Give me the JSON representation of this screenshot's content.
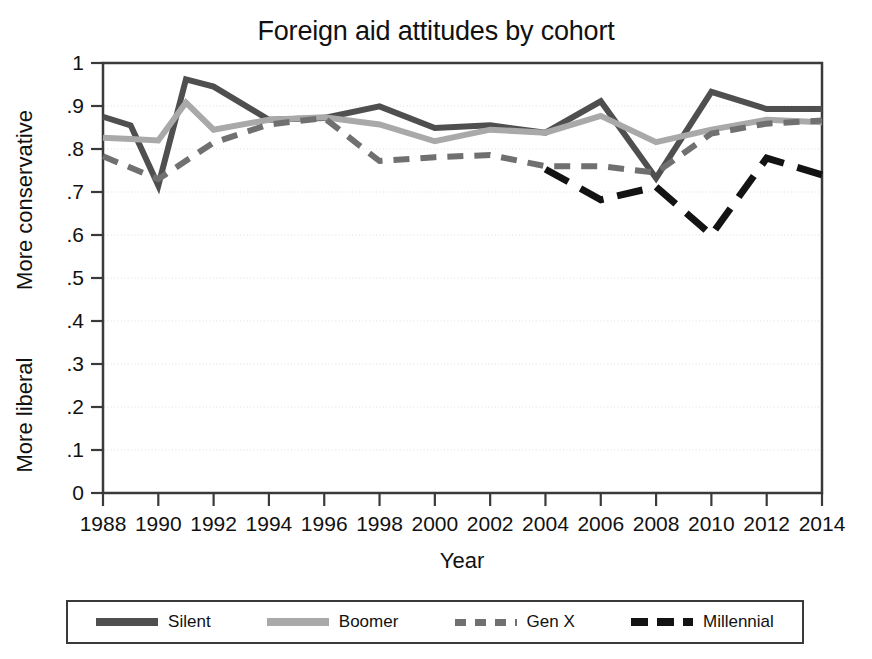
{
  "chart_data": {
    "type": "line",
    "title": "Foreign aid attitudes by cohort",
    "xlabel": "Year",
    "ylabel": "",
    "ylabel_top": "More conservative",
    "ylabel_bottom": "More liberal",
    "grid": true,
    "legend_position": "bottom",
    "xlim": [
      1988,
      2014
    ],
    "ylim": [
      0,
      1
    ],
    "x_ticks": [
      1988,
      1990,
      1992,
      1994,
      1996,
      1998,
      2000,
      2002,
      2004,
      2006,
      2008,
      2010,
      2012,
      2014
    ],
    "x_tick_labels": [
      "1988",
      "1990",
      "1992",
      "1994",
      "1996",
      "1998",
      "2000",
      "2002",
      "2004",
      "2006",
      "2008",
      "2010",
      "2012",
      "2014"
    ],
    "y_ticks": [
      0,
      0.1,
      0.2,
      0.3,
      0.4,
      0.5,
      0.6,
      0.7,
      0.8,
      0.9,
      1
    ],
    "y_tick_labels": [
      "0",
      ".1",
      ".2",
      ".3",
      ".4",
      ".5",
      ".6",
      ".7",
      ".8",
      ".9",
      "1"
    ],
    "series": [
      {
        "name": "Silent",
        "color": "#4f4f4f",
        "style": "solid",
        "width": 6,
        "x": [
          1988,
          1989,
          1990,
          1991,
          1992,
          1994,
          1996,
          1998,
          2000,
          2002,
          2004,
          2006,
          2008,
          2010,
          2012,
          2014
        ],
        "values": [
          0.875,
          0.855,
          0.715,
          0.962,
          0.945,
          0.868,
          0.872,
          0.899,
          0.849,
          0.855,
          0.838,
          0.911,
          0.732,
          0.933,
          0.893,
          0.893
        ]
      },
      {
        "name": "Boomer",
        "color": "#a9a9a9",
        "style": "solid",
        "width": 6,
        "x": [
          1988,
          1989,
          1990,
          1991,
          1992,
          1994,
          1996,
          1998,
          2000,
          2002,
          2004,
          2006,
          2008,
          2010,
          2012,
          2014
        ],
        "values": [
          0.826,
          0.823,
          0.82,
          0.908,
          0.845,
          0.868,
          0.874,
          0.857,
          0.818,
          0.845,
          0.838,
          0.877,
          0.816,
          0.845,
          0.868,
          0.862
        ]
      },
      {
        "name": "Gen X",
        "color": "#707070",
        "style": "dashed",
        "width": 6,
        "dash": "16,11",
        "x": [
          1988,
          1990,
          1992,
          1994,
          1996,
          1998,
          2000,
          2002,
          2004,
          2006,
          2008,
          2010,
          2012,
          2014
        ],
        "values": [
          0.783,
          0.73,
          0.815,
          0.857,
          0.872,
          0.772,
          0.781,
          0.786,
          0.76,
          0.76,
          0.745,
          0.836,
          0.859,
          0.866
        ]
      },
      {
        "name": "Millennial",
        "color": "#131313",
        "style": "dashed",
        "width": 7,
        "dash": "26,14",
        "x": [
          2004,
          2006,
          2008,
          2010,
          2012,
          2014
        ],
        "values": [
          0.753,
          0.682,
          0.712,
          0.6,
          0.779,
          0.74
        ]
      }
    ]
  },
  "legend": {
    "entries": [
      {
        "label": "Silent"
      },
      {
        "label": "Boomer"
      },
      {
        "label": "Gen X"
      },
      {
        "label": "Millennial"
      }
    ]
  }
}
